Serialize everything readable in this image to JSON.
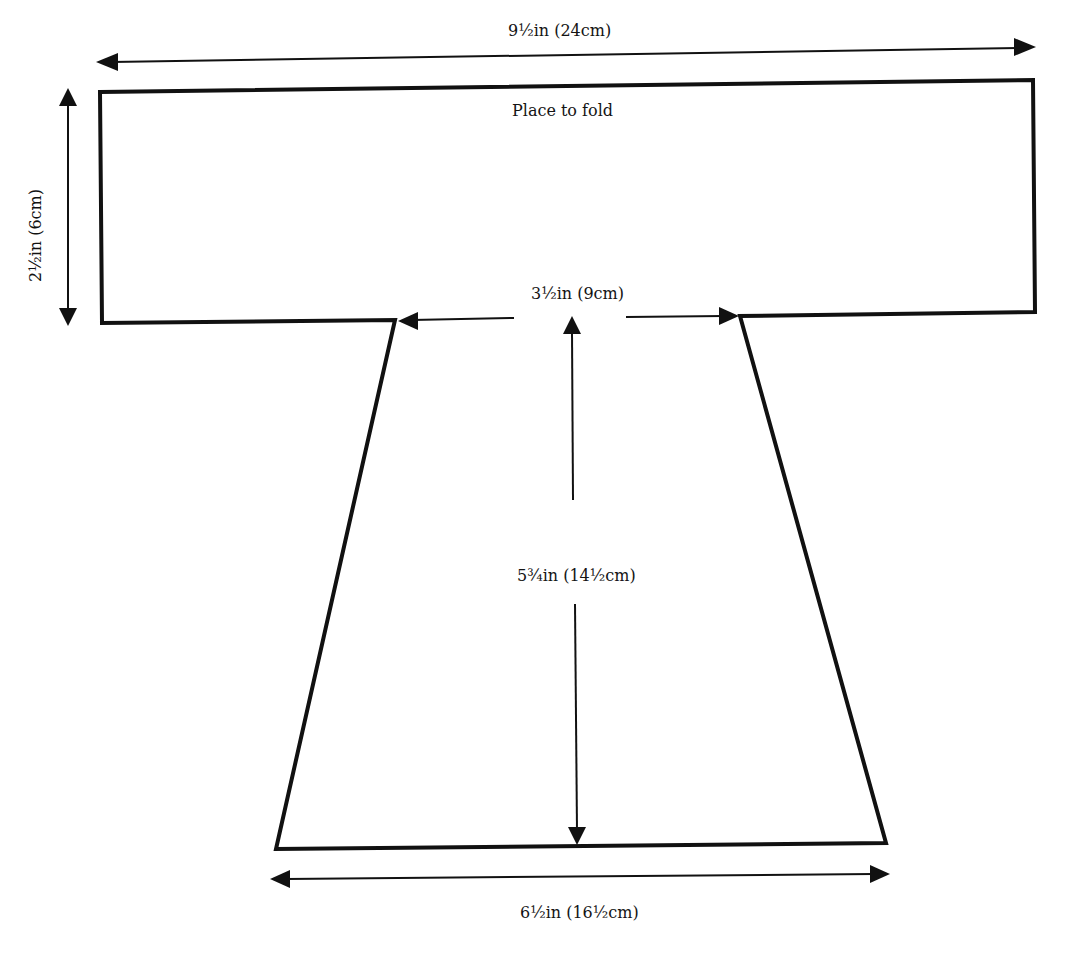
{
  "diagram": {
    "type": "sewing/knitting pattern schematic",
    "shape": "T-shaped garment piece",
    "labels": {
      "top_width": "9½in (24cm)",
      "fold_note": "Place to fold",
      "side_height": "2½in (6cm)",
      "neck_width": "3½in (9cm)",
      "body_length": "5¾in (14½cm)",
      "bottom_width": "6½in (16½cm)"
    },
    "colors": {
      "stroke": "#111111",
      "background": "#ffffff"
    }
  }
}
